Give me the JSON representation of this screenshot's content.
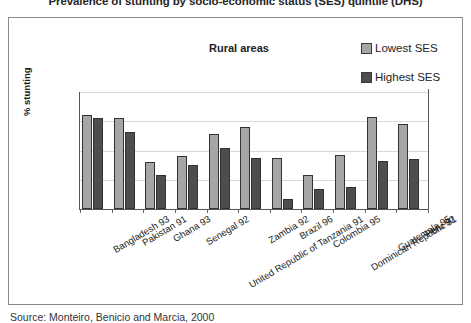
{
  "figure": {
    "title": "Prevalence of stunting by socio-economic status (SES) quintile (DHS)",
    "source": "Source: Monteiro, Benicio and Marcia, 2000"
  },
  "legend": {
    "position": "top-right",
    "entries": [
      {
        "label": "Lowest SES",
        "color": "#a6a6a6",
        "icon": "legend-swatch-lowest"
      },
      {
        "label": "Highest SES",
        "color": "#4d4d4d",
        "icon": "legend-swatch-highest"
      }
    ]
  },
  "chart_data": {
    "type": "bar",
    "title": "Rural areas",
    "xlabel": "",
    "ylabel": "% stunting",
    "ylim": [
      0,
      80
    ],
    "yticks": [
      0,
      20,
      40,
      60,
      80
    ],
    "grid": true,
    "legend_position": "top-right",
    "categories": [
      "Bangladesh 93",
      "Pakistan 91",
      "Ghana 93",
      "Senegal 92",
      "United Republic of Tanzania 91",
      "Zambia 92",
      "Brazil 96",
      "Colombia 95",
      "Dominican Republic 91",
      "Guatemala 95",
      "Peru 92"
    ],
    "series": [
      {
        "name": "Lowest SES",
        "color": "#a6a6a6",
        "values": [
          64,
          62,
          32,
          36,
          51,
          56,
          35,
          23,
          37,
          63,
          58
        ]
      },
      {
        "name": "Highest SES",
        "color": "#4d4d4d",
        "values": [
          62,
          53,
          23,
          30,
          42,
          35,
          7,
          14,
          15,
          33,
          34
        ]
      }
    ]
  }
}
